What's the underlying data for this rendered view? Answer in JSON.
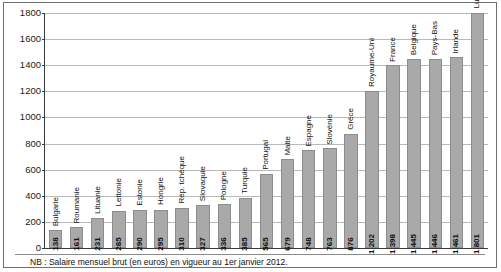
{
  "note": "NB : Salaire mensuel brut (en euros) en vigueur au 1er janvier 2012.",
  "colors": {
    "bar_fill": "#a9a9a9",
    "bar_edge": "#8d8d8d",
    "gridline": "#b9b9b9",
    "axis": "#3a3a3a",
    "frame": "#6f6f6f",
    "text": "#111111"
  },
  "chart_data": {
    "type": "bar",
    "title": "",
    "subtitle": "",
    "xlabel": "",
    "ylabel": "",
    "ylim": [
      0,
      1800
    ],
    "yticks": [
      0,
      200,
      400,
      600,
      800,
      1000,
      1200,
      1400,
      1600,
      1800
    ],
    "ytick_labels": [
      "0",
      "200",
      "400",
      "600",
      "800",
      "1000",
      "1200",
      "1400",
      "1600",
      "1800"
    ],
    "grid": true,
    "legend": false,
    "legend_position": "none",
    "annotation": "NB : Salaire mensuel brut (en euros) en vigueur au 1er janvier 2012.",
    "categories": [
      "Bulgarie",
      "Roumanie",
      "Lituanie",
      "Lettonie",
      "Estonie",
      "Hongrie",
      "Rép. tchèque",
      "Slovaquie",
      "Pologne",
      "Turquie",
      "Portugal",
      "Malte",
      "Espagne",
      "Slovénie",
      "Grèce",
      "Royaume-Uni",
      "France",
      "Belgique",
      "Pays-Bas",
      "Irlande",
      "Luxembourg"
    ],
    "values": [
      138,
      161,
      231,
      285,
      290,
      295,
      310,
      327,
      336,
      385,
      565,
      679,
      748,
      763,
      876,
      1202,
      1398,
      1445,
      1446,
      1461,
      1801
    ],
    "value_labels": [
      "138",
      "161",
      "231",
      "285",
      "290",
      "295",
      "310",
      "327",
      "336",
      "385",
      "565",
      "679",
      "748",
      "763",
      "876",
      "1 202",
      "1 398",
      "1 445",
      "1 446",
      "1 461",
      "1 801"
    ]
  }
}
